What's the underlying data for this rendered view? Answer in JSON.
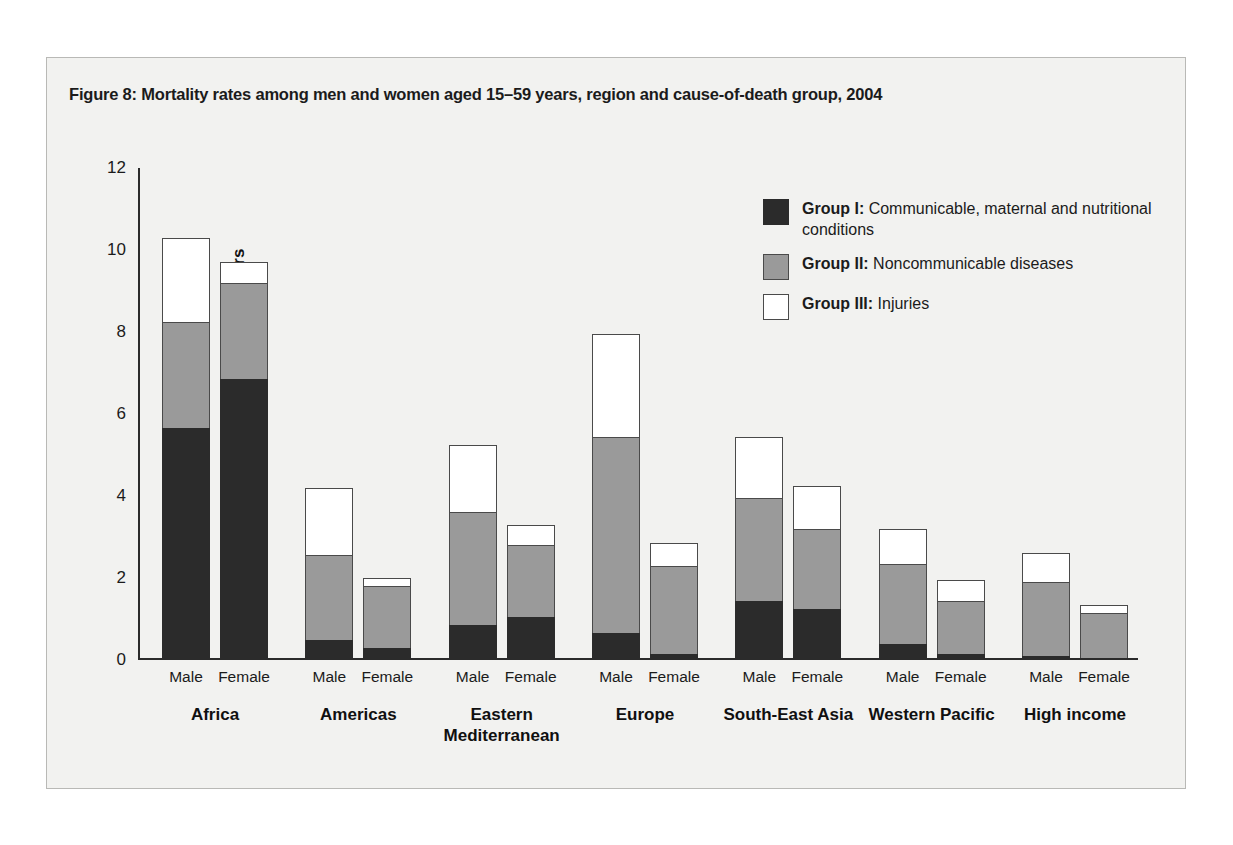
{
  "figure": {
    "title": "Figure 8: Mortality rates among men and women aged 15–59 years, region and cause-of-death group, 2004"
  },
  "legend": {
    "items": [
      {
        "key": "group1",
        "strong": "Group I:",
        "text": " Communicable, maternal and nutritional conditions",
        "color": "#2b2b2b"
      },
      {
        "key": "group2",
        "strong": "Group II:",
        "text": " Noncommunicable diseases",
        "color": "#9a9a9a"
      },
      {
        "key": "group3",
        "strong": "Group III:",
        "text": " Injuries",
        "color": "#ffffff"
      }
    ]
  },
  "chart_data": {
    "type": "bar",
    "stacked": true,
    "title": "Figure 8: Mortality rates among men and women aged 15–59 years, region and cause-of-death group, 2004",
    "xlabel": "",
    "ylabel": "Deaths per 1000 adults aged 15–59 years",
    "ylim": [
      0,
      12
    ],
    "yticks": [
      0,
      2,
      4,
      6,
      8,
      10,
      12
    ],
    "grid": false,
    "legend_position": "inside-top-right",
    "regions": [
      "Africa",
      "Americas",
      "Eastern Mediterranean",
      "Europe",
      "South-East Asia",
      "Western Pacific",
      "High income"
    ],
    "sexes": [
      "Male",
      "Female"
    ],
    "categories": [
      "Africa / Male",
      "Africa / Female",
      "Americas / Male",
      "Americas / Female",
      "Eastern Mediterranean / Male",
      "Eastern Mediterranean / Female",
      "Europe / Male",
      "Europe / Female",
      "South-East Asia / Male",
      "South-East Asia / Female",
      "Western Pacific / Male",
      "Western Pacific / Female",
      "High income / Male",
      "High income / Female"
    ],
    "series": [
      {
        "name": "Group I: Communicable, maternal and nutritional conditions",
        "color": "#2b2b2b",
        "values": [
          5.65,
          6.85,
          0.5,
          0.3,
          0.85,
          1.05,
          0.65,
          0.15,
          1.45,
          1.25,
          0.4,
          0.15,
          0.1,
          0.05
        ]
      },
      {
        "name": "Group II: Noncommunicable diseases",
        "color": "#9a9a9a",
        "values": [
          2.6,
          2.35,
          2.05,
          1.5,
          2.75,
          1.75,
          4.8,
          2.15,
          2.5,
          1.95,
          1.95,
          1.3,
          1.8,
          1.1
        ]
      },
      {
        "name": "Group III: Injuries",
        "color": "#ffffff",
        "values": [
          2.05,
          0.5,
          1.65,
          0.2,
          1.65,
          0.5,
          2.5,
          0.55,
          1.5,
          1.05,
          0.85,
          0.5,
          0.7,
          0.2
        ]
      }
    ],
    "totals": [
      10.3,
      9.7,
      4.2,
      2.0,
      5.25,
      3.3,
      7.95,
      2.85,
      5.45,
      4.25,
      3.2,
      1.95,
      2.6,
      1.35
    ]
  }
}
